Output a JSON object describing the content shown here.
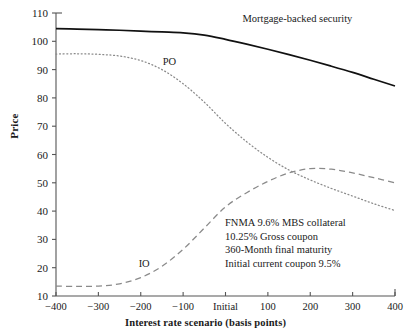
{
  "chart_data": {
    "type": "line",
    "title": "",
    "xlabel": "Interest rate scenario (basis points)",
    "ylabel": "Price",
    "xlim": [
      -400,
      400
    ],
    "ylim": [
      10,
      110
    ],
    "grid": false,
    "legend_position": "inline-labels",
    "x_tick_values": [
      -400,
      -300,
      -200,
      -100,
      0,
      100,
      200,
      300,
      400
    ],
    "x_tick_labels": [
      "−400",
      "−300",
      "−200",
      "−100",
      "Initial",
      "100",
      "200",
      "300",
      "400"
    ],
    "y_tick_values": [
      10,
      20,
      30,
      40,
      50,
      60,
      70,
      80,
      90,
      100,
      110
    ],
    "y_tick_labels": [
      "10",
      "20",
      "30",
      "40",
      "50",
      "60",
      "70",
      "80",
      "90",
      "100",
      "110"
    ],
    "x": [
      -400,
      -350,
      -300,
      -250,
      -200,
      -150,
      -100,
      -50,
      0,
      50,
      100,
      150,
      200,
      250,
      300,
      350,
      400
    ],
    "series": [
      {
        "name": "Mortgage-backed security",
        "style": "solid",
        "color": "#111111",
        "label_x": 40,
        "label_y": 107.5,
        "values": [
          104.5,
          104.3,
          104.1,
          103.9,
          103.6,
          103.3,
          103.0,
          102.2,
          100.7,
          99.0,
          97.2,
          95.3,
          93.3,
          91.2,
          89.0,
          86.6,
          84.2
        ]
      },
      {
        "name": "PO",
        "style": "dotted",
        "color": "#8a8a8a",
        "label_x": -148,
        "label_y": 92.5,
        "values": [
          95.5,
          95.6,
          95.4,
          94.8,
          93.2,
          90.0,
          85.0,
          78.5,
          71.0,
          64.5,
          59.0,
          54.5,
          51.0,
          48.0,
          45.3,
          42.6,
          40.2
        ]
      },
      {
        "name": "IO",
        "style": "dashed",
        "color": "#8a8a8a",
        "label_x": -205,
        "label_y": 21.0,
        "values": [
          13.5,
          13.4,
          13.5,
          14.3,
          16.5,
          20.5,
          26.5,
          34.0,
          41.5,
          46.5,
          50.5,
          53.5,
          55.0,
          54.8,
          53.5,
          51.8,
          50.0
        ]
      }
    ],
    "annotations": [
      "FNMA 9.6% MBS collateral",
      "10.25% Gross coupon",
      "360-Month final maturity",
      "Initial current coupon 9.5%"
    ]
  },
  "plot_geometry": {
    "left": 56,
    "right": 395,
    "top": 13,
    "bottom": 296
  }
}
